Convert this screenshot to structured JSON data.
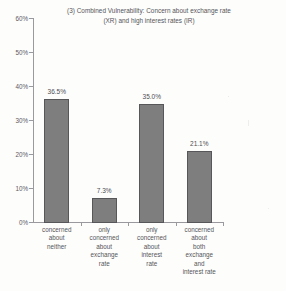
{
  "chart_data": {
    "type": "bar",
    "title": "(3) Combined Vulnerability: Concern about exchange rate\n(XR) and high interest rates (IR)",
    "title_line1": "(3) Combined Vulnerability: Concern about exchange rate",
    "title_line2": "(XR) and high interest rates (IR)",
    "xlabel": "",
    "ylabel": "",
    "ylim": [
      0,
      60
    ],
    "grid": false,
    "legend": false,
    "bar_color": "#7e7e7e",
    "bar_border_color": "#57575a",
    "axis_color": "#9a9a9e",
    "categories": [
      "concerned\nabout\nneither",
      "only\nconcerned\nabout\nexchange\nrate",
      "only\nconcerned\nabout\ninterest\nrate",
      "concerned\nabout\nboth\nexchange\nand\ninterest rate"
    ],
    "values": [
      36.5,
      7.3,
      35.0,
      21.1
    ],
    "value_labels": [
      "36.5%",
      "7.3%",
      "35.0%",
      "21.1%"
    ],
    "y_ticks": [
      0,
      10,
      20,
      30,
      40,
      50,
      60
    ],
    "y_tick_labels": [
      "0%",
      "10%",
      "20%",
      "30%",
      "40%",
      "50%",
      "60%"
    ]
  }
}
